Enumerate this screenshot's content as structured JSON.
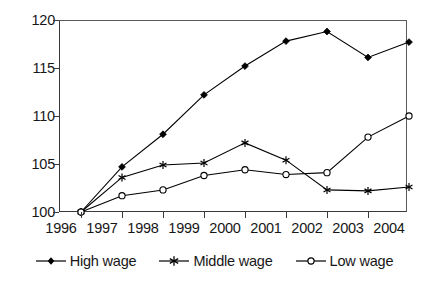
{
  "chart_data": {
    "type": "line",
    "title": "",
    "subtitle": "",
    "xlabel": "",
    "ylabel": "",
    "categories": [
      "1996",
      "1997",
      "1998",
      "1999",
      "2000",
      "2001",
      "2002",
      "2003",
      "2004"
    ],
    "ylim": [
      100,
      120
    ],
    "y_ticks": [
      100,
      105,
      110,
      115,
      120
    ],
    "grid": false,
    "legend_position": "bottom",
    "series": [
      {
        "name": "High wage",
        "marker": "filled-diamond",
        "color": "#000000",
        "values": [
          100.0,
          104.7,
          108.1,
          112.2,
          115.2,
          117.8,
          118.8,
          116.1,
          117.7
        ]
      },
      {
        "name": "Middle wage",
        "marker": "asterisk",
        "color": "#000000",
        "values": [
          100.0,
          103.6,
          104.9,
          105.1,
          107.2,
          105.4,
          102.3,
          102.2,
          102.6
        ]
      },
      {
        "name": "Low wage",
        "marker": "open-circle",
        "color": "#000000",
        "values": [
          100.0,
          101.7,
          102.3,
          103.8,
          104.4,
          103.9,
          104.1,
          107.8,
          110.0
        ]
      }
    ]
  },
  "axis": {
    "y_tick_labels": [
      "120",
      "115",
      "110",
      "105",
      "100"
    ],
    "x_tick_labels": [
      "1996",
      "1997",
      "1998",
      "1999",
      "2000",
      "2001",
      "2002",
      "2003",
      "2004"
    ]
  },
  "legend": {
    "entries": [
      {
        "label": "High wage",
        "marker": "filled-diamond"
      },
      {
        "label": "Middle wage",
        "marker": "asterisk"
      },
      {
        "label": "Low wage",
        "marker": "open-circle"
      }
    ]
  }
}
